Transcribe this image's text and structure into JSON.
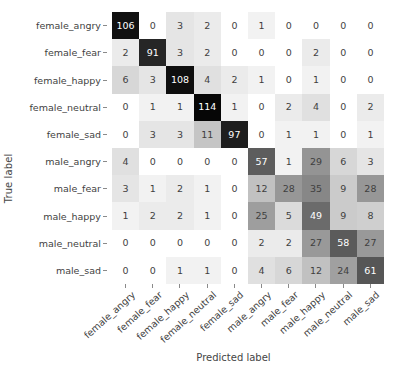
{
  "chart_data": {
    "type": "heatmap",
    "subtype": "confusion-matrix",
    "title": "",
    "xlabel": "Predicted label",
    "ylabel": "True label",
    "grid": false,
    "legend": "none",
    "colormap": "Greys",
    "normalized": false,
    "categories": [
      "female_angry",
      "female_fear",
      "female_happy",
      "female_neutral",
      "female_sad",
      "male_angry",
      "male_fear",
      "male_happy",
      "male_neutral",
      "male_sad"
    ],
    "x_tick_labels": [
      "female_angry",
      "female_fear",
      "female_happy",
      "female_neutral",
      "female_sad",
      "male_angry",
      "male_fear",
      "male_happy",
      "male_neutral",
      "male_sad"
    ],
    "y_tick_labels": [
      "female_angry",
      "female_fear",
      "female_happy",
      "female_neutral",
      "female_sad",
      "male_angry",
      "male_fear",
      "male_happy",
      "male_neutral",
      "male_sad"
    ],
    "vmin": 0,
    "vmax": 114,
    "rows": [
      {
        "label": "female_angry",
        "values": [
          106,
          0,
          3,
          2,
          0,
          1,
          0,
          0,
          0,
          0
        ]
      },
      {
        "label": "female_fear",
        "values": [
          2,
          91,
          3,
          2,
          0,
          0,
          0,
          2,
          0,
          0
        ]
      },
      {
        "label": "female_happy",
        "values": [
          6,
          3,
          108,
          4,
          2,
          1,
          0,
          1,
          0,
          0
        ]
      },
      {
        "label": "female_neutral",
        "values": [
          0,
          1,
          1,
          114,
          1,
          0,
          2,
          4,
          0,
          2
        ]
      },
      {
        "label": "female_sad",
        "values": [
          0,
          3,
          3,
          11,
          97,
          0,
          1,
          1,
          0,
          1
        ]
      },
      {
        "label": "male_angry",
        "values": [
          4,
          0,
          0,
          0,
          0,
          57,
          1,
          29,
          6,
          3
        ]
      },
      {
        "label": "male_fear",
        "values": [
          3,
          1,
          2,
          1,
          0,
          12,
          28,
          35,
          9,
          28
        ]
      },
      {
        "label": "male_happy",
        "values": [
          1,
          2,
          2,
          1,
          0,
          25,
          5,
          49,
          9,
          8
        ]
      },
      {
        "label": "male_neutral",
        "values": [
          0,
          0,
          0,
          0,
          0,
          2,
          2,
          27,
          58,
          27
        ]
      },
      {
        "label": "male_sad",
        "values": [
          0,
          0,
          1,
          1,
          0,
          4,
          6,
          12,
          24,
          61
        ]
      }
    ]
  },
  "colors": {
    "background": "#ffffff",
    "text": "#3f3f3f",
    "axis_label": "#454545",
    "tickmark": "#8a8a8a",
    "cell_dark": "#262626",
    "cell_light": "#ffffff",
    "cell_text_light": "#ffffff",
    "cell_text_dark": "#3f3f3f"
  }
}
